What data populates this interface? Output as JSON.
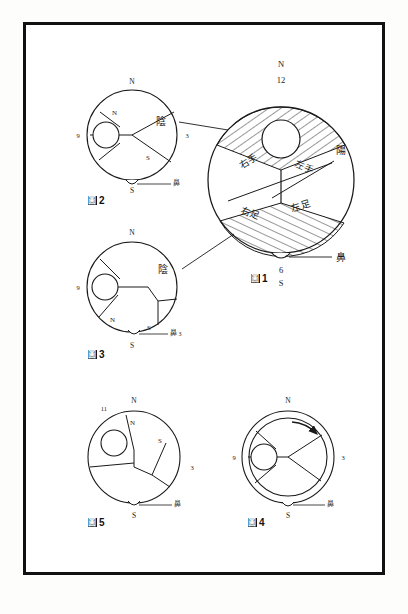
{
  "page": {
    "background_color": "#fdfdfc",
    "frame_color": "#111111",
    "ink_color": "#1a1a1a"
  },
  "figures": [
    {
      "id": "fig1",
      "caption_glyph": "圖",
      "caption_number": "1",
      "caption": "圖 1",
      "compass": {
        "north": "N",
        "south": "S"
      },
      "clock_numbers": {
        "top": "12",
        "bottom": "6"
      },
      "region_labels": {
        "upper_left": "右手",
        "upper_right": "左手",
        "lower_left": "右足",
        "lower_right": "左足"
      },
      "annotations": {
        "yin_upper": "陰",
        "yin_lower": "陰",
        "yang": "陽",
        "nose": "鼻"
      },
      "hatched": true
    },
    {
      "id": "fig2",
      "caption_glyph": "圖",
      "caption_number": "2",
      "caption": "圖 2",
      "compass": {
        "north": "N",
        "south": "S"
      },
      "inner_compass": {
        "north": "N",
        "south": "S"
      },
      "clock_numbers": {
        "left": "9",
        "right": "3"
      },
      "annotations": {
        "nose": "鼻"
      },
      "hatched": false
    },
    {
      "id": "fig3",
      "caption_glyph": "圖",
      "caption_number": "3",
      "caption": "圖 3",
      "compass": {
        "north": "N",
        "south": "S"
      },
      "inner_compass": {
        "north": "N",
        "south": "S"
      },
      "clock_numbers": {
        "left": "9",
        "right": "3"
      },
      "annotations": {
        "nose": "鼻"
      },
      "hatched": false
    },
    {
      "id": "fig5",
      "caption_glyph": "圖",
      "caption_number": "5",
      "caption": "圖 5",
      "compass": {
        "north": "N",
        "south": "S"
      },
      "inner_compass": {
        "north": "N",
        "south": "S"
      },
      "clock_numbers": {
        "upper_left": "11",
        "right": "3"
      },
      "annotations": {
        "nose": "鼻"
      },
      "hatched": false
    },
    {
      "id": "fig4",
      "caption_glyph": "圖",
      "caption_number": "4",
      "caption": "圖 4",
      "compass": {
        "north": "N",
        "south": "S"
      },
      "clock_numbers": {
        "left": "9",
        "right": "3"
      },
      "annotations": {
        "nose": "鼻"
      },
      "double_ring": true,
      "rotation_arrow": true,
      "hatched": false
    }
  ]
}
